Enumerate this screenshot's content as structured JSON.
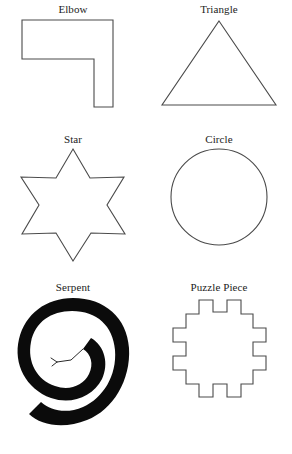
{
  "page": {
    "background_color": "#ffffff",
    "stroke_color": "#4a4a4a",
    "fill_color": "#0b0b0b",
    "columns": 2,
    "rows": 3
  },
  "shapes": [
    {
      "id": "elbow",
      "label": "Elbow",
      "icon": "elbow-shape-icon",
      "style": "outline",
      "description": "L-shaped hexagon, right angles"
    },
    {
      "id": "triangle",
      "label": "Triangle",
      "icon": "triangle-shape-icon",
      "style": "outline",
      "description": "Isosceles triangle, apex up"
    },
    {
      "id": "star",
      "label": "Star",
      "icon": "star-shape-icon",
      "style": "outline",
      "description": "Six-pointed star, hexagram"
    },
    {
      "id": "circle",
      "label": "Circle",
      "icon": "circle-shape-icon",
      "style": "outline",
      "description": "Plain circle outline"
    },
    {
      "id": "serpent",
      "label": "Serpent",
      "icon": "serpent-spiral-icon",
      "style": "solid",
      "description": "Thick black coiled spiral with forked tongue at center"
    },
    {
      "id": "puzzle-piece",
      "label": "Puzzle Piece",
      "icon": "puzzle-piece-shape-icon",
      "style": "outline",
      "description": "Square outline with two square tabs on each side"
    }
  ]
}
